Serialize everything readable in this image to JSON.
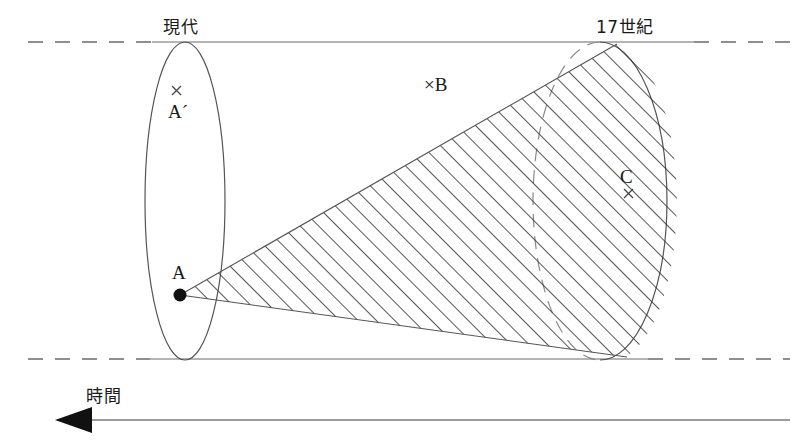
{
  "figure": {
    "type": "light-cone-time-diagram",
    "background_color": "#ffffff",
    "line_color": "#444444",
    "hatch_color": "#2b2b2b",
    "text_color": "#1a1a1a"
  },
  "axis": {
    "time_arrow_label": "時間",
    "arrow_direction": "left",
    "arrow_line_y": 420,
    "arrow_tip_x": 55,
    "arrow_end_x": 790
  },
  "boundaries": {
    "top_label": "現代",
    "right_label": "17世紀",
    "top_line_y": 42,
    "bottom_line_y": 359
  },
  "points": [
    {
      "id": "A",
      "label": "A",
      "marker": "filled-dot",
      "x": 180,
      "y": 295
    },
    {
      "id": "Ap",
      "label": "A´",
      "marker": "cross",
      "x": 176,
      "y": 90
    },
    {
      "id": "B",
      "label": "B",
      "marker": "cross",
      "x": 430,
      "y": 85
    },
    {
      "id": "C",
      "label": "C",
      "marker": "cross",
      "x": 628,
      "y": 193
    }
  ],
  "ellipses": {
    "near": {
      "cx": 185,
      "cy": 201,
      "rx": 40,
      "ry": 159
    },
    "far": {
      "cx": 600,
      "cy": 201,
      "rx": 67,
      "ry": 159
    }
  },
  "cone": {
    "apex_x": 180,
    "apex_y": 295,
    "hatched": true,
    "hatch_angle_deg": 45,
    "hatch_spacing_px": 13
  }
}
